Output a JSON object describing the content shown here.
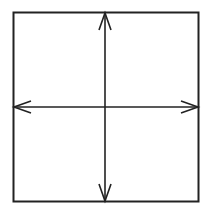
{
  "diagram": {
    "type": "square-with-crossed-double-arrows",
    "stroke_color": "#222222",
    "background_color": "#ffffff",
    "square": {
      "x": 13.5,
      "y": 12.5,
      "width": 185,
      "height": 189
    },
    "vertical_arrow": {
      "x": 105,
      "y1": 13,
      "y2": 201,
      "heads": [
        "up",
        "down"
      ]
    },
    "horizontal_arrow": {
      "y": 107,
      "x1": 14,
      "x2": 198,
      "heads": [
        "left",
        "right"
      ]
    }
  }
}
